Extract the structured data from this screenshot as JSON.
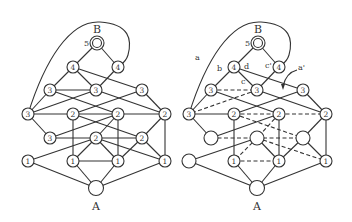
{
  "figure": {
    "left_graph": {
      "source_label": "B",
      "sink_label": "A",
      "source_number": "5",
      "nodes": [
        {
          "id": "B",
          "x": 97,
          "y": 43,
          "label": "",
          "double": true
        },
        {
          "id": "n4a",
          "x": 73,
          "y": 67,
          "label": "4"
        },
        {
          "id": "n4b",
          "x": 118,
          "y": 67,
          "label": "4"
        },
        {
          "id": "n3a",
          "x": 50,
          "y": 90,
          "label": "3"
        },
        {
          "id": "n3b",
          "x": 96,
          "y": 90,
          "label": "3"
        },
        {
          "id": "n3c",
          "x": 142,
          "y": 90,
          "label": "3"
        },
        {
          "id": "n3d",
          "x": 28,
          "y": 114,
          "label": "3"
        },
        {
          "id": "n2a",
          "x": 73,
          "y": 114,
          "label": "2"
        },
        {
          "id": "n2b",
          "x": 118,
          "y": 114,
          "label": "2"
        },
        {
          "id": "n2c",
          "x": 165,
          "y": 114,
          "label": "2"
        },
        {
          "id": "n3e",
          "x": 50,
          "y": 138,
          "label": "3"
        },
        {
          "id": "n2d",
          "x": 96,
          "y": 138,
          "label": "2"
        },
        {
          "id": "n2e",
          "x": 142,
          "y": 138,
          "label": "2"
        },
        {
          "id": "n1a",
          "x": 28,
          "y": 161,
          "label": "1"
        },
        {
          "id": "n1b",
          "x": 73,
          "y": 161,
          "label": "1"
        },
        {
          "id": "n1c",
          "x": 118,
          "y": 161,
          "label": "1"
        },
        {
          "id": "n1d",
          "x": 165,
          "y": 161,
          "label": "1"
        },
        {
          "id": "A",
          "x": 96,
          "y": 188,
          "label": ""
        }
      ]
    },
    "right_graph": {
      "source_label": "B",
      "sink_label": "A",
      "source_number": "5",
      "edge_labels": [
        "a",
        "b",
        "d",
        "c'",
        "c",
        "a'"
      ],
      "node_labels": [
        "4",
        "4",
        "3",
        "3",
        "3",
        "3",
        "2",
        "2",
        "2",
        "",
        "",
        "",
        "",
        "1",
        "1",
        "1",
        ""
      ]
    }
  }
}
